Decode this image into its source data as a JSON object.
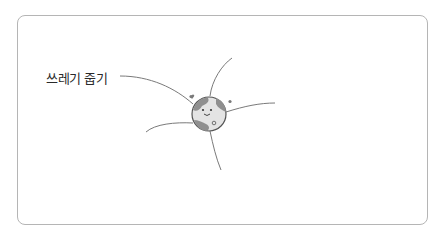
{
  "mindmap": {
    "central_node": {
      "icon": "smiling-earth-globe-icon"
    },
    "branches": [
      {
        "label": "쓰레기 줍기"
      },
      {
        "label": ""
      },
      {
        "label": ""
      },
      {
        "label": ""
      },
      {
        "label": ""
      }
    ]
  },
  "colors": {
    "line": "#7a7a7a",
    "globe_land": "#8f8f8f",
    "globe_sea": "#e4e4e4",
    "border": "#b5b5b5"
  }
}
